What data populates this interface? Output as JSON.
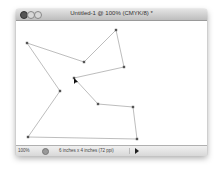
{
  "window": {
    "title": "Untitled-1 @ 100% (CMYK/8) *",
    "controls": [
      "close",
      "minimize",
      "zoom"
    ]
  },
  "canvas": {
    "shape_type": "polygon path with anchor points",
    "points": [
      [
        11,
        22
      ],
      [
        68,
        41
      ],
      [
        100,
        9
      ],
      [
        108,
        46
      ],
      [
        58,
        57
      ],
      [
        82,
        83
      ],
      [
        117,
        86
      ],
      [
        121,
        118
      ],
      [
        12,
        116
      ],
      [
        44,
        70
      ]
    ],
    "cursor_point": [
      58,
      57
    ],
    "line_color": "#a0a0a0",
    "anchor_color": "#555555"
  },
  "statusbar": {
    "zoom": "100%",
    "doc_info": "6 inches x 4 inches (72 ppi)",
    "menu_arrow": "play-triangle"
  }
}
